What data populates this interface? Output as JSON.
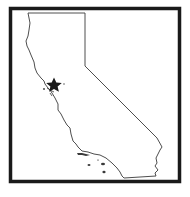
{
  "map": {
    "region": "California",
    "marker": {
      "type": "star",
      "color": "#1a1a1a",
      "position": {
        "x": 54,
        "y": 85
      }
    },
    "colors": {
      "background": "#ffffff",
      "frame": "#1a1a1a",
      "outline": "#3a3a3a"
    }
  }
}
